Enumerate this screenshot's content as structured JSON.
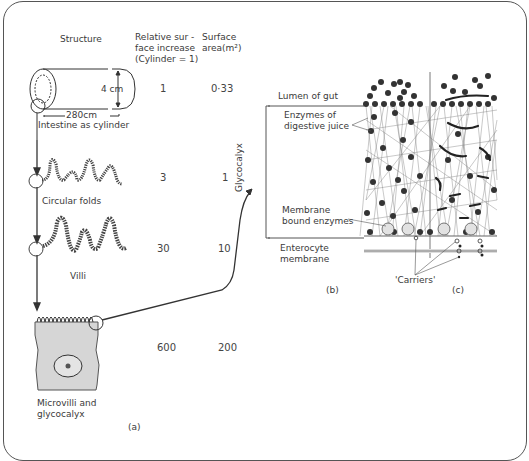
{
  "headers": {
    "structure": "Structure",
    "relative": "Relative sur -\nface increase\n(Cylinder = 1)",
    "area": "Surface\narea(m²)"
  },
  "rows": [
    {
      "structure": "Intestine as cylinder",
      "relative": "1",
      "area": "0·33"
    },
    {
      "structure": "Circular folds",
      "relative": "3",
      "area": "1"
    },
    {
      "structure": "Villi",
      "relative": "30",
      "area": "10"
    },
    {
      "structure": "Microvilli and\nglycocalyx",
      "relative": "600",
      "area": "200"
    }
  ],
  "cylinder": {
    "diameter": "4 cm",
    "length": "280cm"
  },
  "panel_b": {
    "lumen": "Lumen of gut",
    "enzymes_juice": "Enzymes of\ndigestive juice",
    "glycocalyx": "Glycocalyx",
    "membrane_enzymes": "Membrane\nbound enzymes",
    "enterocyte": "Enterocyte\nmembrane",
    "carriers": "'Carriers'",
    "label_b": "(b)",
    "label_c": "(c)"
  },
  "label_a": "(a)"
}
